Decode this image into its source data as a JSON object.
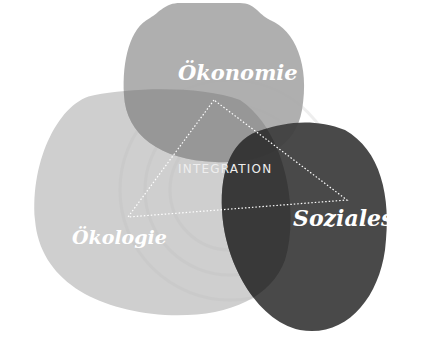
{
  "diagram": {
    "type": "venn-triangle",
    "circles": [
      {
        "id": "oekonomie",
        "label": "Ökonomie",
        "color": "#a9a9a9"
      },
      {
        "id": "oekologie",
        "label": "Ökologie",
        "color": "#cdcdcd"
      },
      {
        "id": "soziales",
        "label": "Soziales",
        "color": "#3c3c3c"
      }
    ],
    "center_label": "INTEGRATION",
    "triangle": {
      "vertices": [
        [
          214,
          100
        ],
        [
          128,
          217
        ],
        [
          347,
          200
        ]
      ],
      "stroke": "#ffffff",
      "style": "dotted"
    }
  }
}
